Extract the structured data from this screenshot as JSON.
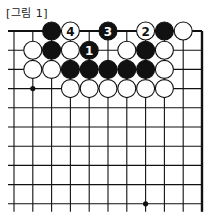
{
  "caption": "[그림 1]",
  "board": {
    "columns": 11,
    "rows": 10,
    "x0": 14,
    "y0": 31,
    "dx": 18.8,
    "dy": 19.2,
    "open_left": true,
    "open_bottom": true,
    "star_points": [
      [
        1,
        3
      ],
      [
        7,
        9
      ]
    ],
    "stones": [
      {
        "c": 2,
        "r": 0,
        "color": "black"
      },
      {
        "c": 3,
        "r": 0,
        "color": "white",
        "label": "4"
      },
      {
        "c": 5,
        "r": 0,
        "color": "black",
        "label": "3"
      },
      {
        "c": 7,
        "r": 0,
        "color": "white",
        "label": "2"
      },
      {
        "c": 8,
        "r": 0,
        "color": "black"
      },
      {
        "c": 9,
        "r": 0,
        "color": "white"
      },
      {
        "c": 1,
        "r": 1,
        "color": "white"
      },
      {
        "c": 2,
        "r": 1,
        "color": "black"
      },
      {
        "c": 3,
        "r": 1,
        "color": "white"
      },
      {
        "c": 4,
        "r": 1,
        "color": "black",
        "label": "1"
      },
      {
        "c": 6,
        "r": 1,
        "color": "white"
      },
      {
        "c": 7,
        "r": 1,
        "color": "black"
      },
      {
        "c": 8,
        "r": 1,
        "color": "white"
      },
      {
        "c": 1,
        "r": 2,
        "color": "white"
      },
      {
        "c": 2,
        "r": 2,
        "color": "white"
      },
      {
        "c": 3,
        "r": 2,
        "color": "black"
      },
      {
        "c": 4,
        "r": 2,
        "color": "black"
      },
      {
        "c": 5,
        "r": 2,
        "color": "black"
      },
      {
        "c": 6,
        "r": 2,
        "color": "black"
      },
      {
        "c": 7,
        "r": 2,
        "color": "black"
      },
      {
        "c": 8,
        "r": 2,
        "color": "white"
      },
      {
        "c": 3,
        "r": 3,
        "color": "white"
      },
      {
        "c": 4,
        "r": 3,
        "color": "white"
      },
      {
        "c": 5,
        "r": 3,
        "color": "white"
      },
      {
        "c": 6,
        "r": 3,
        "color": "white"
      },
      {
        "c": 7,
        "r": 3,
        "color": "white"
      },
      {
        "c": 8,
        "r": 3,
        "color": "white"
      }
    ]
  }
}
